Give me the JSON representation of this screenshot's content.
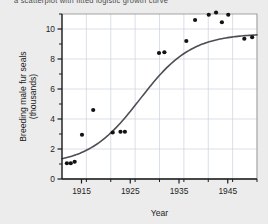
{
  "figure": {
    "background_color": "#ececec",
    "plot_background_color": "#ffffff",
    "grid_color": "#c9d2dc",
    "axis_color": "#1d1d1d",
    "curve_color": "#4d4d55",
    "point_color": "#121212",
    "cropped_caption": "a scatterplot with fitted logistic growth curve"
  },
  "chart_data": {
    "type": "scatter",
    "title": "",
    "xlabel": "Year",
    "ylabel": "Breeding male fur seals (thousands)",
    "ylabel_line1": "Breeding male fur seals",
    "ylabel_line2": "(thousands)",
    "xlim": [
      1911,
      1951
    ],
    "ylim": [
      0,
      11
    ],
    "xticks": [
      1915,
      1925,
      1935,
      1945
    ],
    "xtick_labels": [
      "1915",
      "1925",
      "1935",
      "1945"
    ],
    "xticks_minor": [
      1911,
      1916,
      1921,
      1926,
      1931,
      1936,
      1941,
      1946,
      1951
    ],
    "yticks": [
      0,
      2,
      4,
      6,
      8,
      10
    ],
    "ytick_labels": [
      "0",
      "2",
      "4",
      "6",
      "8",
      "10"
    ],
    "yticks_minor": [
      1,
      3,
      5,
      7,
      9,
      11
    ],
    "grid": true,
    "grid_x_step": 5,
    "grid_y_step": 2,
    "legend": null,
    "points": [
      {
        "x": 1912.0,
        "y": 1.05
      },
      {
        "x": 1912.8,
        "y": 1.05
      },
      {
        "x": 1913.6,
        "y": 1.15
      },
      {
        "x": 1915.1,
        "y": 2.95
      },
      {
        "x": 1917.4,
        "y": 4.6
      },
      {
        "x": 1921.4,
        "y": 3.1
      },
      {
        "x": 1923.0,
        "y": 3.15
      },
      {
        "x": 1923.9,
        "y": 3.15
      },
      {
        "x": 1930.9,
        "y": 8.4
      },
      {
        "x": 1932.0,
        "y": 8.45
      },
      {
        "x": 1936.5,
        "y": 9.2
      },
      {
        "x": 1938.3,
        "y": 10.6
      },
      {
        "x": 1941.1,
        "y": 10.95
      },
      {
        "x": 1942.6,
        "y": 11.1
      },
      {
        "x": 1943.8,
        "y": 10.45
      },
      {
        "x": 1945.1,
        "y": 10.95
      },
      {
        "x": 1948.4,
        "y": 9.35
      },
      {
        "x": 1950.0,
        "y": 9.45
      }
    ],
    "fit_curve": {
      "kind": "logistic",
      "asymptote": 9.7,
      "midpoint_year": 1927.0,
      "growth_rate": 0.19,
      "lower": 0.95
    }
  }
}
